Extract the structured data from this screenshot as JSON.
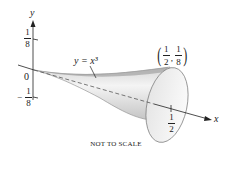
{
  "diagram": {
    "axes": {
      "x_label": "x",
      "y_label": "y",
      "origin_label": "0"
    },
    "y_ticks": [
      {
        "label_num": "1",
        "label_den": "8",
        "sign": ""
      },
      {
        "label_num": "1",
        "label_den": "8",
        "sign": "−"
      }
    ],
    "x_tick": {
      "label_num": "1",
      "label_den": "2"
    },
    "curve_label": "y = x³",
    "point_label": {
      "x_num": "1",
      "x_den": "2",
      "y_num": "1",
      "y_den": "8",
      "separator": ","
    },
    "caption": "NOT TO SCALE",
    "colors": {
      "surface_light": "#f2f2f2",
      "surface_dark": "#bdbdbd",
      "line": "#222222"
    }
  }
}
